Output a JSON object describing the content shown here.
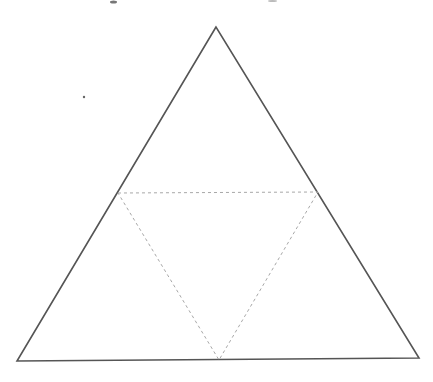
{
  "diagram": {
    "type": "triangle-subdivision",
    "background": "#ffffff",
    "outer_triangle": {
      "vertices": [
        [
          216,
          27
        ],
        [
          17,
          361
        ],
        [
          419,
          358
        ]
      ],
      "stroke": "#555555",
      "stroke_width": 1.6,
      "style": "solid"
    },
    "inner_triangle": {
      "vertices": [
        [
          118,
          193
        ],
        [
          318,
          192
        ],
        [
          219,
          360
        ]
      ],
      "stroke": "#a8a8a8",
      "stroke_width": 1,
      "style": "dotted"
    },
    "stray_dot": {
      "x": 84,
      "y": 97,
      "r": 1.2,
      "color": "#666666"
    },
    "top_text_fragments": [
      {
        "x": 110,
        "y": 2,
        "w": 7,
        "h": 3,
        "color": "#777777"
      },
      {
        "x": 268,
        "y": 1,
        "w": 9,
        "h": 2,
        "color": "#bbbbbb"
      }
    ]
  }
}
